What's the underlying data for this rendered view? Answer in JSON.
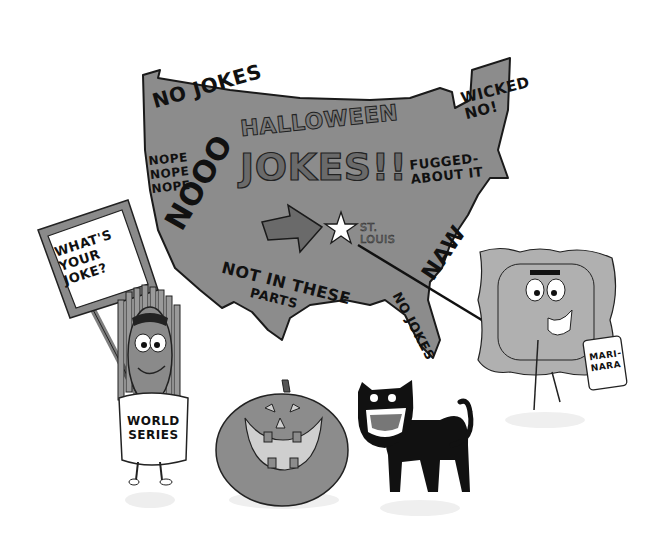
{
  "scene": {
    "description": "Cartoon illustration of a gray US map covered in 'no' phrases, with Halloween joke characters around it",
    "colors": {
      "background": "#ffffff",
      "map_fill": "#8c8c8c",
      "outline": "#1a1a1a",
      "sign_border": "#7f7f7f",
      "pumpkin": "#8a8a8a",
      "cat": "#111111",
      "ravioli": "#b0b0b0"
    }
  },
  "map": {
    "title_line1": "HALLOWEEN",
    "title_line2": "JOKES!!",
    "marker_label": "ST.\nLOUIS",
    "phrases": {
      "northwest": "NO JOKES",
      "west": "NOPE\nNOPE\nNOPE",
      "southwest": "NOOO",
      "texas_line1": "NOT IN THESE",
      "texas_line2": "PARTS",
      "new_england": "WICKED\nNO!",
      "new_york": "FUGGED-\nABOUT IT",
      "southeast": "NAW",
      "florida": "NO JOKES"
    }
  },
  "characters": {
    "corn_sign": "WHAT'S\nYOUR\nJOKE?",
    "corn_can_label": "WORLD\nSERIES",
    "marinara_can_label": "MARI-\nNARA"
  }
}
